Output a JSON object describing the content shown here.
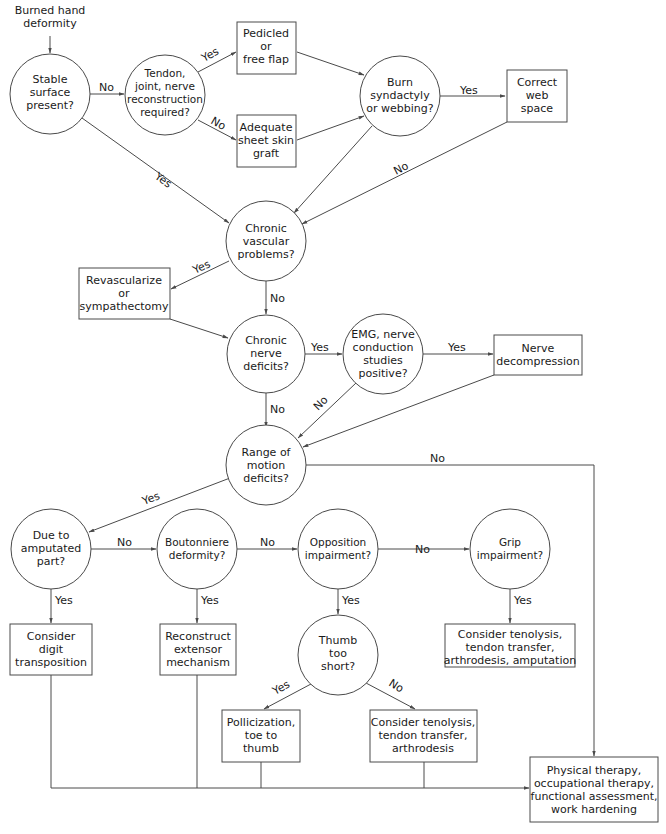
{
  "diagram": {
    "start_label": [
      "Burned hand",
      "deformity"
    ],
    "nodes": {
      "stable_surface": {
        "type": "decision",
        "lines": [
          "Stable",
          "surface",
          "present?"
        ]
      },
      "tendon_reconstruction": {
        "type": "decision",
        "lines": [
          "Tendon,",
          "joint, nerve",
          "reconstruction",
          "required?"
        ]
      },
      "pedicled_flap": {
        "type": "action",
        "lines": [
          "Pedicled",
          "or",
          "free flap"
        ]
      },
      "sheet_skin_graft": {
        "type": "action",
        "lines": [
          "Adequate",
          "sheet skin",
          "graft"
        ]
      },
      "burn_syndactyly": {
        "type": "decision",
        "lines": [
          "Burn",
          "syndactyly",
          "or webbing?"
        ]
      },
      "correct_web_space": {
        "type": "action",
        "lines": [
          "Correct",
          "web",
          "space"
        ]
      },
      "chronic_vascular": {
        "type": "decision",
        "lines": [
          "Chronic",
          "vascular",
          "problems?"
        ]
      },
      "revascularize": {
        "type": "action",
        "lines": [
          "Revascularize",
          "or",
          "sympathectomy"
        ]
      },
      "chronic_nerve": {
        "type": "decision",
        "lines": [
          "Chronic",
          "nerve",
          "deficits?"
        ]
      },
      "emg_positive": {
        "type": "decision",
        "lines": [
          "EMG, nerve",
          "conduction",
          "studies",
          "positive?"
        ]
      },
      "nerve_decompression": {
        "type": "action",
        "lines": [
          "Nerve",
          "decompression"
        ]
      },
      "range_of_motion": {
        "type": "decision",
        "lines": [
          "Range of",
          "motion",
          "deficits?"
        ]
      },
      "amputated_part": {
        "type": "decision",
        "lines": [
          "Due to",
          "amputated",
          "part?"
        ]
      },
      "boutonniere": {
        "type": "decision",
        "lines": [
          "Boutonniere",
          "deformity?"
        ]
      },
      "opposition": {
        "type": "decision",
        "lines": [
          "Opposition",
          "impairment?"
        ]
      },
      "grip": {
        "type": "decision",
        "lines": [
          "Grip",
          "impairment?"
        ]
      },
      "digit_transposition": {
        "type": "action",
        "lines": [
          "Consider",
          "digit",
          "transposition"
        ]
      },
      "reconstruct_extensor": {
        "type": "action",
        "lines": [
          "Reconstruct",
          "extensor",
          "mechanism"
        ]
      },
      "thumb_short": {
        "type": "decision",
        "lines": [
          "Thumb",
          "too",
          "short?"
        ]
      },
      "grip_treatment": {
        "type": "action",
        "lines": [
          "Consider tenolysis,",
          "tendon transfer,",
          "arthrodesis, amputation"
        ]
      },
      "pollicization": {
        "type": "action",
        "lines": [
          "Pollicization,",
          "toe to",
          "thumb"
        ]
      },
      "thumb_treatment": {
        "type": "action",
        "lines": [
          "Consider tenolysis,",
          "tendon transfer,",
          "arthrodesis"
        ]
      },
      "therapy": {
        "type": "action",
        "lines": [
          "Physical therapy,",
          "occupational therapy,",
          "functional assessment,",
          "work hardening"
        ]
      }
    },
    "edge_labels": {
      "stable_no": "No",
      "stable_yes": "Yes",
      "tendon_yes": "Yes",
      "tendon_no": "No",
      "burn_yes": "Yes",
      "web_no": "No",
      "vascular_yes": "Yes",
      "vascular_no": "No",
      "nerve_yes": "Yes",
      "nerve_no": "No",
      "emg_yes": "Yes",
      "emg_no": "No",
      "rom_no": "No",
      "rom_yes": "Yes",
      "amputated_no": "No",
      "amputated_yes": "Yes",
      "boutonniere_no": "No",
      "boutonniere_yes": "Yes",
      "opposition_no": "No",
      "opposition_yes": "Yes",
      "grip_yes": "Yes",
      "thumb_yes": "Yes",
      "thumb_no": "No"
    },
    "colors": {
      "line": "#4a4a4a",
      "text": "#1a1a1a",
      "background": "#ffffff"
    }
  }
}
